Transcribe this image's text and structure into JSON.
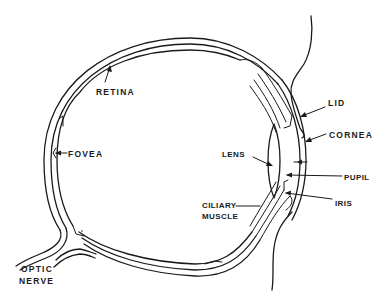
{
  "diagram": {
    "labels": {
      "retina": "RETINA",
      "fovea": "FOVEA",
      "lens": "LENS",
      "lid": "LID",
      "cornea": "CORNEA",
      "pupil": "PUPIL",
      "iris": "IRIS",
      "ciliary_muscle_line1": "CILIARY",
      "ciliary_muscle_line2": "MUSCLE",
      "optic_nerve_line1": "OPTIC",
      "optic_nerve_line2": "NERVE"
    },
    "colors": {
      "line": "#1a1a1a",
      "background": "#ffffff"
    }
  }
}
